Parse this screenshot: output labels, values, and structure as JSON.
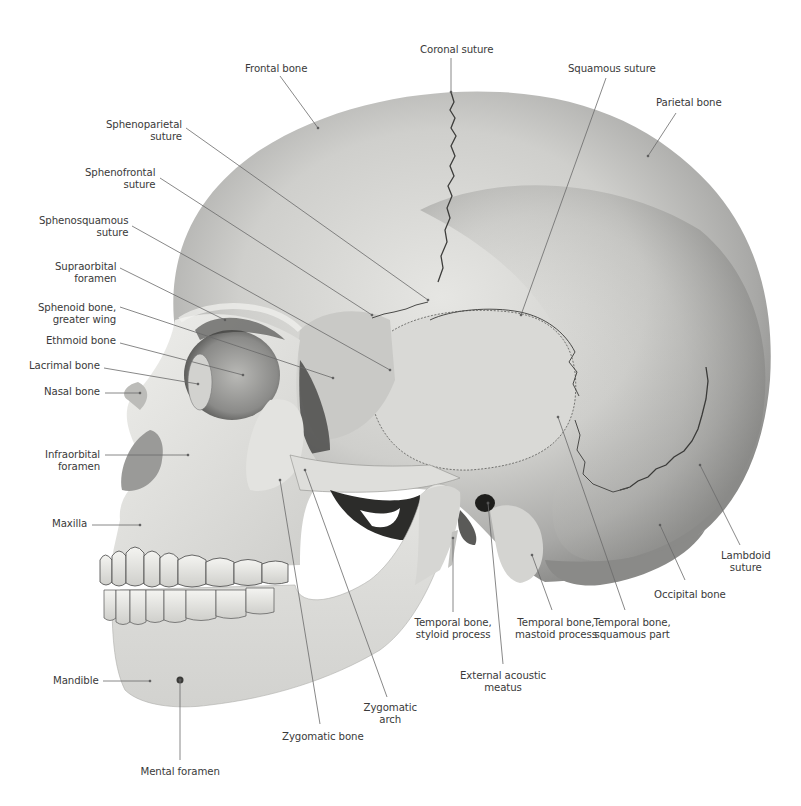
{
  "figure": {
    "colors": {
      "background": "#ffffff",
      "bone_light": "#e9e9e6",
      "bone_mid": "#c8c8c5",
      "bone_dark": "#8e8e8c",
      "cavity": "#2a2a2a",
      "suture": "#3a3a3a",
      "leader_line": "#6a6a6a",
      "label_text": "#3a3a3a"
    }
  },
  "labels": [
    {
      "id": "frontal-bone",
      "lines": [
        "Frontal bone"
      ],
      "x": 245,
      "y": 63,
      "align": "left",
      "anchor": [
        318,
        128
      ],
      "from": [
        280,
        76
      ]
    },
    {
      "id": "coronal-suture",
      "lines": [
        "Coronal suture"
      ],
      "x": 420,
      "y": 44,
      "align": "left",
      "anchor": [
        451,
        92
      ],
      "from": [
        451,
        58
      ]
    },
    {
      "id": "squamous-suture",
      "lines": [
        "Squamous suture"
      ],
      "x": 568,
      "y": 63,
      "align": "left",
      "anchor": [
        521,
        315
      ],
      "from": [
        606,
        78
      ]
    },
    {
      "id": "parietal-bone",
      "lines": [
        "Parietal bone"
      ],
      "x": 656,
      "y": 97,
      "align": "left",
      "anchor": [
        648,
        156
      ],
      "from": [
        676,
        113
      ]
    },
    {
      "id": "sphenoparietal-suture",
      "lines": [
        "Sphenoparietal",
        "suture"
      ],
      "x": 182,
      "y": 119,
      "align": "right",
      "anchor": [
        428,
        300
      ],
      "from": [
        186,
        128
      ]
    },
    {
      "id": "sphenofrontal-suture",
      "lines": [
        "Sphenofrontal",
        "suture"
      ],
      "x": 155,
      "y": 167,
      "align": "right",
      "anchor": [
        372,
        315
      ],
      "from": [
        160,
        178
      ]
    },
    {
      "id": "sphenosquamous-suture",
      "lines": [
        "Sphenosquamous",
        "suture"
      ],
      "x": 128,
      "y": 215,
      "align": "right",
      "anchor": [
        390,
        370
      ],
      "from": [
        132,
        226
      ]
    },
    {
      "id": "supraorbital-foramen",
      "lines": [
        "Supraorbital",
        "foramen"
      ],
      "x": 116,
      "y": 261,
      "align": "right",
      "anchor": [
        225,
        320
      ],
      "from": [
        120,
        268
      ]
    },
    {
      "id": "sphenoid-greater-wing",
      "lines": [
        "Sphenoid bone,",
        "greater wing"
      ],
      "x": 116,
      "y": 302,
      "align": "right",
      "anchor": [
        333,
        378
      ],
      "from": [
        120,
        307
      ]
    },
    {
      "id": "ethmoid-bone",
      "lines": [
        "Ethmoid bone"
      ],
      "x": 116,
      "y": 335,
      "align": "right",
      "anchor": [
        243,
        375
      ],
      "from": [
        120,
        343
      ]
    },
    {
      "id": "lacrimal-bone",
      "lines": [
        "Lacrimal bone"
      ],
      "x": 100,
      "y": 360,
      "align": "right",
      "anchor": [
        198,
        384
      ],
      "from": [
        104,
        368
      ]
    },
    {
      "id": "nasal-bone",
      "lines": [
        "Nasal bone"
      ],
      "x": 100,
      "y": 386,
      "align": "right",
      "anchor": [
        140,
        393
      ],
      "from": [
        105,
        393
      ]
    },
    {
      "id": "infraorbital-foramen",
      "lines": [
        "Infraorbital",
        "foramen"
      ],
      "x": 100,
      "y": 449,
      "align": "right",
      "anchor": [
        188,
        455
      ],
      "from": [
        105,
        455
      ]
    },
    {
      "id": "maxilla",
      "lines": [
        "Maxilla"
      ],
      "x": 87,
      "y": 518,
      "align": "right",
      "anchor": [
        140,
        525
      ],
      "from": [
        92,
        525
      ]
    },
    {
      "id": "mandible",
      "lines": [
        "Mandible"
      ],
      "x": 99,
      "y": 675,
      "align": "right",
      "anchor": [
        150,
        681
      ],
      "from": [
        103,
        681
      ]
    },
    {
      "id": "mental-foramen",
      "lines": [
        "Mental foramen"
      ],
      "x": 180,
      "y": 766,
      "align": "center",
      "anchor": [
        180,
        680
      ],
      "from": [
        180,
        760
      ]
    },
    {
      "id": "zygomatic-bone",
      "lines": [
        "Zygomatic bone"
      ],
      "x": 323,
      "y": 731,
      "align": "center",
      "anchor": [
        280,
        480
      ],
      "from": [
        320,
        724
      ]
    },
    {
      "id": "zygomatic-arch",
      "lines": [
        "Zygomatic",
        "arch"
      ],
      "x": 390,
      "y": 702,
      "align": "center",
      "anchor": [
        305,
        470
      ],
      "from": [
        387,
        697
      ]
    },
    {
      "id": "temporal-styloid",
      "lines": [
        "Temporal bone,",
        "styloid process"
      ],
      "x": 453,
      "y": 617,
      "align": "center",
      "anchor": [
        453,
        538
      ],
      "from": [
        453,
        612
      ]
    },
    {
      "id": "external-acoustic-meatus",
      "lines": [
        "External acoustic",
        "meatus"
      ],
      "x": 503,
      "y": 670,
      "align": "center",
      "anchor": [
        488,
        503
      ],
      "from": [
        503,
        664
      ]
    },
    {
      "id": "temporal-mastoid",
      "lines": [
        "Temporal bone,",
        "mastoid process"
      ],
      "x": 556,
      "y": 617,
      "align": "center",
      "anchor": [
        532,
        555
      ],
      "from": [
        552,
        610
      ]
    },
    {
      "id": "temporal-squamous",
      "lines": [
        "Temporal bone,",
        "squamous part"
      ],
      "x": 632,
      "y": 617,
      "align": "center",
      "anchor": [
        558,
        417
      ],
      "from": [
        625,
        610
      ]
    },
    {
      "id": "occipital-bone",
      "lines": [
        "Occipital bone"
      ],
      "x": 690,
      "y": 589,
      "align": "center",
      "anchor": [
        660,
        525
      ],
      "from": [
        685,
        580
      ]
    },
    {
      "id": "lambdoid-suture",
      "lines": [
        "Lambdoid",
        "suture"
      ],
      "x": 746,
      "y": 550,
      "align": "center",
      "anchor": [
        700,
        465
      ],
      "from": [
        740,
        545
      ]
    }
  ]
}
